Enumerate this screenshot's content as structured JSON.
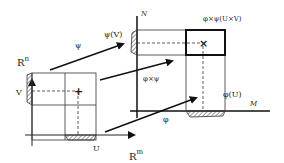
{
  "diagram": {
    "left_space": {
      "vertical_axis_label": "R",
      "vertical_axis_sup": "n",
      "horizontal_axis_label": "R",
      "horizontal_axis_sup": "m",
      "set_v_label": "V",
      "set_u_label": "U",
      "point_marker": "+"
    },
    "right_space": {
      "vertical_axis_label": "N",
      "horizontal_axis_label": "M",
      "image_v_label": "ψ(V)",
      "image_u_label": "φ(U)",
      "image_product_label": "φ×ψ(U×V)",
      "point_marker": "×"
    },
    "maps": {
      "psi_label": "ψ",
      "phi_label": "φ",
      "product_label": "φ×ψ"
    },
    "colors": {
      "ink": "#222222",
      "background": "#ffffff"
    }
  }
}
